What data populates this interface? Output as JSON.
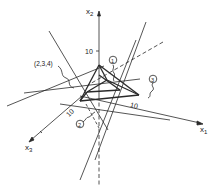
{
  "axes": {
    "x1": {
      "label": "x",
      "subscript": "1"
    },
    "x2": {
      "label": "x",
      "subscript": "2"
    },
    "x3": {
      "label": "x",
      "subscript": "3"
    }
  },
  "ticks": {
    "x2_tick": "10",
    "x1_tick": "10",
    "x3_tick": "10"
  },
  "annotations": {
    "point_label": "(2,3,4)",
    "circle_1": "1",
    "circle_2": "2",
    "circle_3": "3"
  },
  "colors": {
    "line": "#2a2a2a",
    "background": "#ffffff"
  }
}
